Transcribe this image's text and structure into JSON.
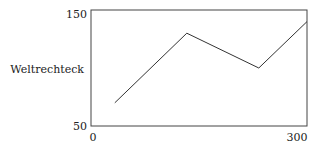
{
  "chart_data": {
    "type": "line",
    "title": "",
    "xlabel": "",
    "ylabel": "Weltrechteck",
    "xlim": [
      0,
      300
    ],
    "ylim": [
      50,
      150
    ],
    "x_ticks": [
      "0",
      "300"
    ],
    "y_ticks": [
      "50",
      "150"
    ],
    "grid": false,
    "legend": null,
    "series": [
      {
        "name": "",
        "color": "#333333",
        "x": [
          33,
          133,
          233,
          300
        ],
        "y": [
          70,
          130,
          100,
          140
        ]
      }
    ]
  },
  "labels": {
    "y_axis": "Weltrechteck",
    "x_min": "0",
    "x_max": "300",
    "y_min": "50",
    "y_max": "150"
  }
}
